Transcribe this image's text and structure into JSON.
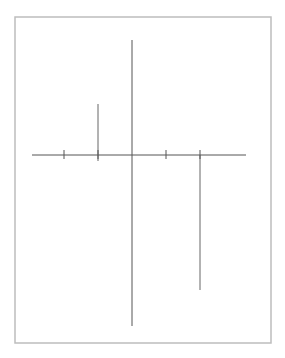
{
  "figure": {
    "type": "area-between-curves",
    "axes": {
      "x_label": "x",
      "y_label": "y",
      "x_ticks": [
        {
          "value": -2,
          "label": ""
        },
        {
          "value": -1,
          "label": "−1"
        },
        {
          "value": 1,
          "label": "1"
        },
        {
          "value": 2,
          "label": "2"
        }
      ]
    },
    "curves": [
      {
        "name": "parabola",
        "label": "y = x² − 2x",
        "label_main": "y = x",
        "label_sup": "2",
        "label_rest": " − 2x"
      },
      {
        "name": "neg-exp",
        "label": "y = −eˣ",
        "label_main": "y = −e",
        "label_sup": "x"
      }
    ],
    "shaded_region": {
      "x_from": -1,
      "x_to": 2,
      "fill": "#dcdcdc"
    },
    "colors": {
      "curve": "#707070",
      "axis": "#555555",
      "frame": "#bdbdbd",
      "fill": "#dcdcdc"
    }
  }
}
